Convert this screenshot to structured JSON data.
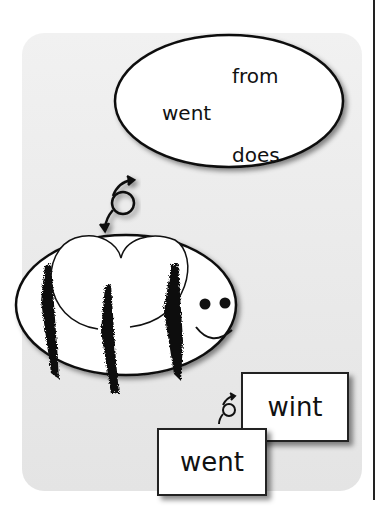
{
  "bubble": {
    "words": [
      "from",
      "went",
      "does"
    ]
  },
  "cards": {
    "back": "wint",
    "front": "went"
  },
  "colors": {
    "panel": "#ececec",
    "ink": "#111111",
    "paper": "#ffffff"
  }
}
